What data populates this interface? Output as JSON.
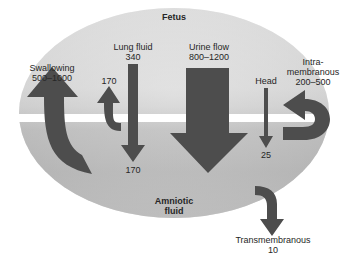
{
  "figure": {
    "title_region": "Fetus",
    "compartments": {
      "fetus": "Fetus",
      "amniotic_line1": "Amniotic",
      "amniotic_line2": "fluid"
    },
    "colors": {
      "arrow": "#4d4d4d",
      "ellipse_top": "#d9d9d9",
      "ellipse_bottom": "#a8a8a8",
      "band": "#ffffff",
      "text": "#262626"
    },
    "flows": [
      {
        "id": "swallowing",
        "label": "Swallowing",
        "value": "500–1000",
        "direction": "up",
        "units_implied": "mL/day"
      },
      {
        "id": "lung-fluid",
        "label": "Lung fluid",
        "value": "340",
        "direction": "down",
        "branch_up_value": "170",
        "branch_down_value": "170"
      },
      {
        "id": "urine-flow",
        "label": "Urine flow",
        "value": "800–1200",
        "direction": "down"
      },
      {
        "id": "head",
        "label": "Head",
        "value": "25",
        "direction": "down"
      },
      {
        "id": "intramembranous",
        "label_line1": "Intra-",
        "label_line2": "membranous",
        "value": "200–500",
        "direction": "left"
      },
      {
        "id": "transmembranous",
        "label": "Transmembranous",
        "value": "10",
        "direction": "down"
      }
    ]
  }
}
